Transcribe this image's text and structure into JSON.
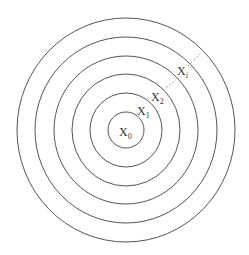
{
  "diagram": {
    "type": "concentric-circles",
    "center": {
      "x": 126,
      "y": 130
    },
    "stroke_color": "#555555",
    "circles": [
      {
        "rx": 18,
        "ry": 18
      },
      {
        "rx": 36,
        "ry": 37
      },
      {
        "rx": 54,
        "ry": 56
      },
      {
        "rx": 72,
        "ry": 74
      },
      {
        "rx": 91,
        "ry": 93
      },
      {
        "rx": 109,
        "ry": 112
      }
    ],
    "labels": [
      {
        "base": "X",
        "sub": "0",
        "x": 119,
        "y": 136
      },
      {
        "base": "X",
        "sub": "1",
        "x": 137,
        "y": 115
      },
      {
        "base": "X",
        "sub": "2",
        "x": 151,
        "y": 101
      },
      {
        "base": "X",
        "sub": "i",
        "x": 177,
        "y": 75
      }
    ],
    "dotted_segments": [
      {
        "x1": 163,
        "y1": 90,
        "x2": 176,
        "y2": 80
      },
      {
        "x1": 188,
        "y1": 66,
        "x2": 201,
        "y2": 53
      }
    ]
  }
}
